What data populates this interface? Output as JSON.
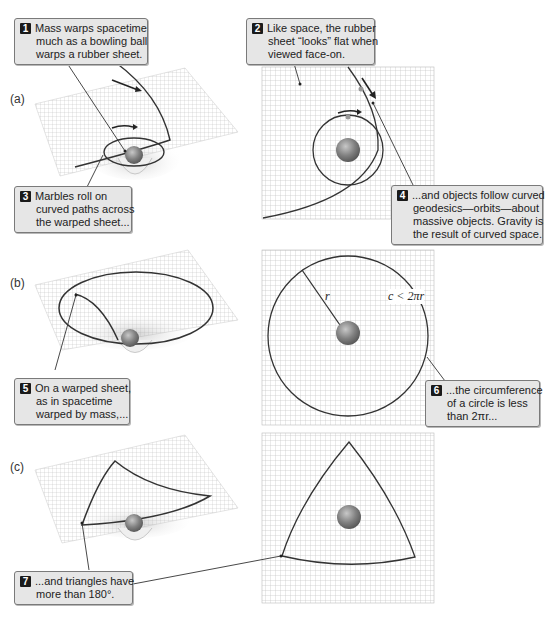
{
  "figure": {
    "panels": [
      {
        "id": "a",
        "label": "(a)"
      },
      {
        "id": "b",
        "label": "(b)"
      },
      {
        "id": "c",
        "label": "(c)"
      }
    ],
    "math_labels": {
      "radius": "r",
      "circumference": "c < 2πr"
    },
    "callouts": [
      {
        "num": "1",
        "lines": [
          "Mass warps spacetime",
          "much as a bowling ball",
          "warps a rubber sheet."
        ]
      },
      {
        "num": "2",
        "lines": [
          "Like space, the rubber",
          "sheet “looks” flat when",
          "viewed face-on."
        ]
      },
      {
        "num": "3",
        "lines": [
          "Marbles roll on",
          "curved paths across",
          "the warped sheet..."
        ]
      },
      {
        "num": "4",
        "lines": [
          "...and objects follow curved",
          "geodesics—orbits—about",
          "massive objects. Gravity is",
          "the result of curved space."
        ]
      },
      {
        "num": "5",
        "lines": [
          "On a warped sheet,",
          "as in spacetime",
          "warped by mass,..."
        ]
      },
      {
        "num": "6",
        "lines": [
          "...the circumference",
          "of a circle is less",
          "than 2πr..."
        ]
      },
      {
        "num": "7",
        "lines": [
          "...and triangles have",
          "more than 180°."
        ]
      }
    ],
    "colors": {
      "grid": "#b5b5b5",
      "path": "#333333",
      "ball": "#7a7a7a",
      "callout_bg": "#e6e6e6"
    }
  }
}
